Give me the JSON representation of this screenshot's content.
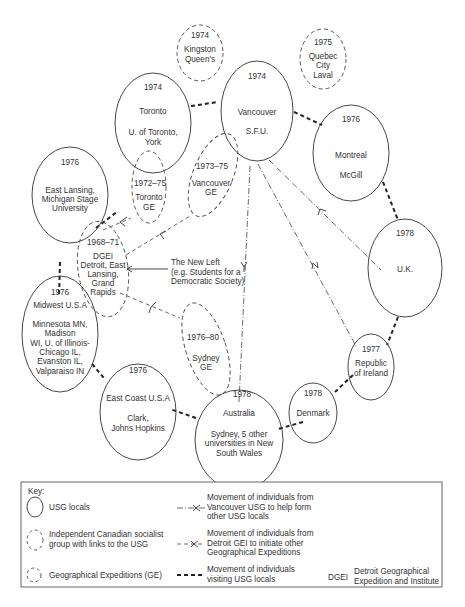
{
  "diagram": {
    "nodes": {
      "kingston": {
        "year": "1974",
        "line1": "Kingston",
        "line2": "Queen's",
        "type": "independent"
      },
      "quebec": {
        "year": "1975",
        "line1": "Quebec",
        "line2": "City",
        "line3": "Laval",
        "type": "independent"
      },
      "toronto": {
        "year": "1974",
        "line1": "Toronto",
        "line2": "U. of Toronto,",
        "line3": "York",
        "type": "usg"
      },
      "vancouver": {
        "year": "1974",
        "line1": "Vancouver",
        "line2": "S.F.U.",
        "type": "usg"
      },
      "montreal": {
        "year": "1976",
        "line1": "Montreal",
        "line2": "McGill",
        "type": "usg"
      },
      "east_lansing": {
        "year": "1976",
        "line1": "East Lansing,",
        "line2": "Michigan Stage",
        "line3": "University",
        "type": "usg"
      },
      "toronto_ge": {
        "year": "1972–75",
        "line1": "Toronto",
        "line2": "GE",
        "type": "ge"
      },
      "vancouver_ge": {
        "year": "1973–75",
        "line1": "Vancouver",
        "line2": "GE",
        "type": "ge"
      },
      "dgei": {
        "year": "1968–71",
        "line1": "DGEI",
        "line2": "Detroit, East",
        "line3": "Lansing,",
        "line4": "Grand",
        "line5": "Rapids",
        "type": "ge"
      },
      "uk": {
        "year": "1978",
        "line1": "U.K.",
        "type": "usg"
      },
      "midwest": {
        "year": "1976",
        "line1": "Midwest U.S.A",
        "line2": "Minnesota MN,",
        "line3": "Madison",
        "line4": "WI, U. of Illinois-",
        "line5": "Chicago IL,",
        "line6": "Evanston IL,",
        "line7": "Valparaiso IN",
        "type": "usg"
      },
      "sydney_ge": {
        "year": "1976–80",
        "line1": "Sydney",
        "line2": "GE",
        "type": "ge"
      },
      "ireland": {
        "year": "1977",
        "line1": "Republic",
        "line2": "of Ireland",
        "type": "usg"
      },
      "east_coast": {
        "year": "1976",
        "line1": "East Coast U.S.A",
        "line2": "Clark,",
        "line3": "Johns Hopkins",
        "type": "usg"
      },
      "australia": {
        "year": "1978",
        "line1": "Australia",
        "line2": "Sydney, 5 other",
        "line3": "universities in New",
        "line4": "South Wales",
        "type": "usg"
      },
      "denmark": {
        "year": "1978",
        "line1": "Denmark",
        "type": "usg"
      }
    },
    "annotation": {
      "line1": "The New Left",
      "line2": "(e.g. Students for a",
      "line3": "Democratic Society)"
    }
  },
  "key": {
    "title": "Key:",
    "items": [
      {
        "label": "USG locals"
      },
      {
        "label_line1": "Independent Canadian socialist",
        "label_line2": "group with links to the USG"
      },
      {
        "label": "Geographical Expeditions (GE)"
      }
    ],
    "movements": [
      {
        "line1": "Movement of individuals from",
        "line2": "Vancouver USG to help form",
        "line3": "other USG locals"
      },
      {
        "line1": "Movement of individuals from",
        "line2": "Detroit GEI to initiate other",
        "line3": "Geographical Expeditions"
      },
      {
        "line1": "Movement of individuals",
        "line2": "visiting USG locals"
      }
    ],
    "abbreviation": {
      "abbr": "DGEI",
      "line1": "Detroit Geographical",
      "line2": "Expedition and Institute"
    }
  }
}
